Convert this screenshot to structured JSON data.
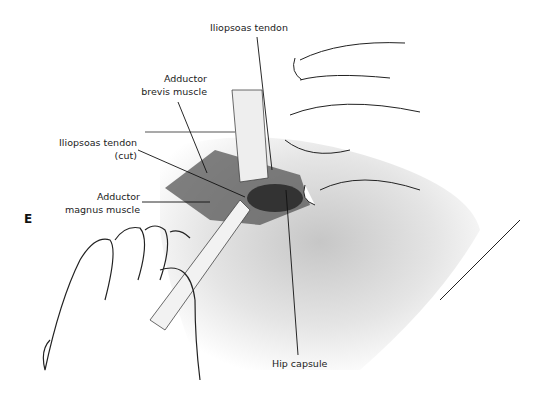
{
  "figure": {
    "panel_letter": "E",
    "labels": {
      "iliopsoas_tendon": "Iliopsoas tendon",
      "adductor_brevis_1": "Adductor",
      "adductor_brevis_2": "brevis muscle",
      "iliopsoas_cut_1": "Iliopsoas tendon",
      "iliopsoas_cut_2": "(cut)",
      "adductor_magnus_1": "Adductor",
      "adductor_magnus_2": "magnus muscle",
      "hip_capsule": "Hip capsule"
    }
  }
}
